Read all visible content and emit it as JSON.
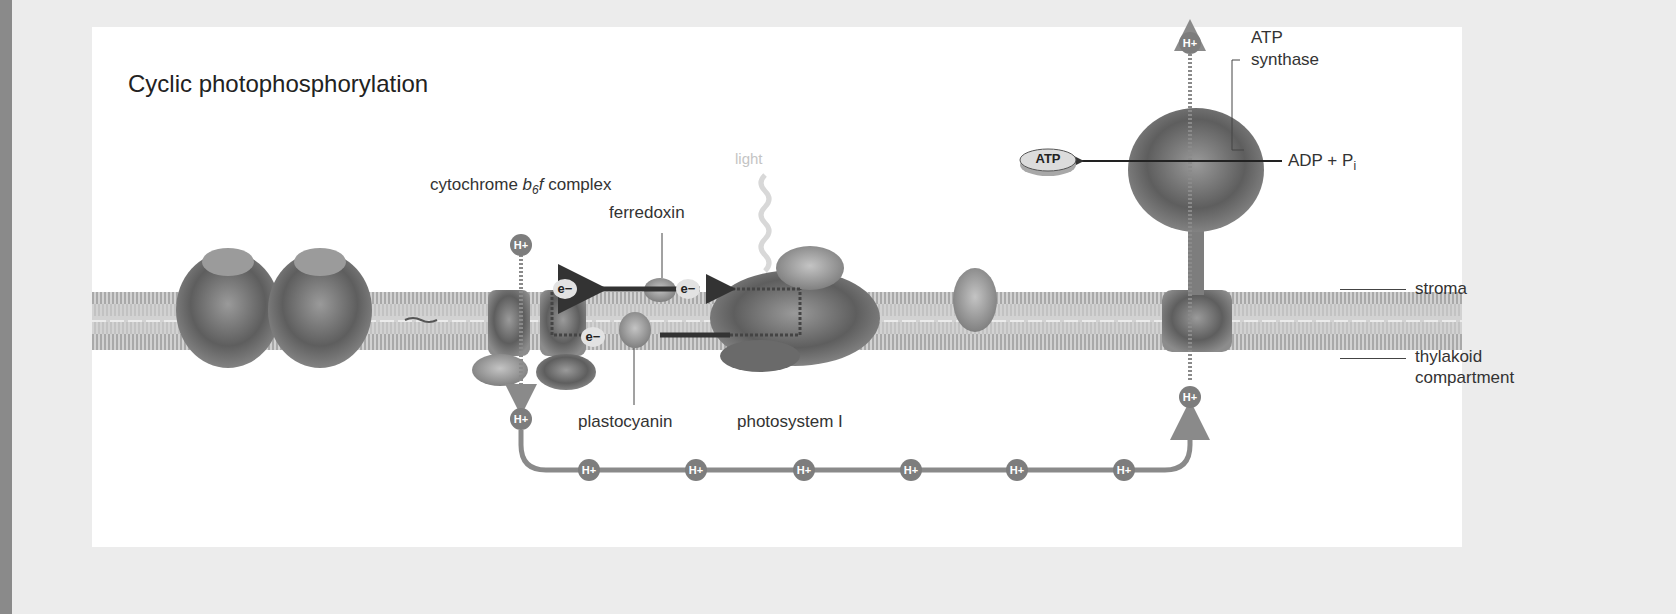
{
  "figure": {
    "title": "Cyclic photophosphorylation",
    "colors": {
      "proton_fill": "#7d7d7d",
      "proton_text": "#ffffff",
      "pump_path": "#8a8a8a",
      "arrow_dark": "#3a3a3a",
      "membrane": "#b8b8b8",
      "panel_bg": "#ffffff",
      "page_bg": "#ececec"
    }
  },
  "labels": {
    "cytochrome_prefix": "cytochrome ",
    "cytochrome_b": "b",
    "cytochrome_sub": "6",
    "cytochrome_f": "f",
    "cytochrome_suffix": " complex",
    "ferredoxin": "ferredoxin",
    "light": "light",
    "plastocyanin": "plastocyanin",
    "photosystem_i": "photosystem I",
    "atp_synthase_line1": "ATP",
    "atp_synthase_line2": "synthase",
    "adp_pi_text": "ADP + P",
    "adp_pi_sub": "i",
    "atp_product": "ATP",
    "stroma": "stroma",
    "thylakoid_line1": "thylakoid",
    "thylakoid_line2": "compartment"
  },
  "particles": {
    "proton": "H+",
    "electron": "e−"
  },
  "proton_path_count": 6,
  "components": [
    "photosystem II (unlabeled)",
    "cytochrome b6f complex",
    "ferredoxin",
    "plastocyanin",
    "photosystem I",
    "ferredoxin-NADP+ reductase (unlabeled)",
    "ATP synthase"
  ]
}
